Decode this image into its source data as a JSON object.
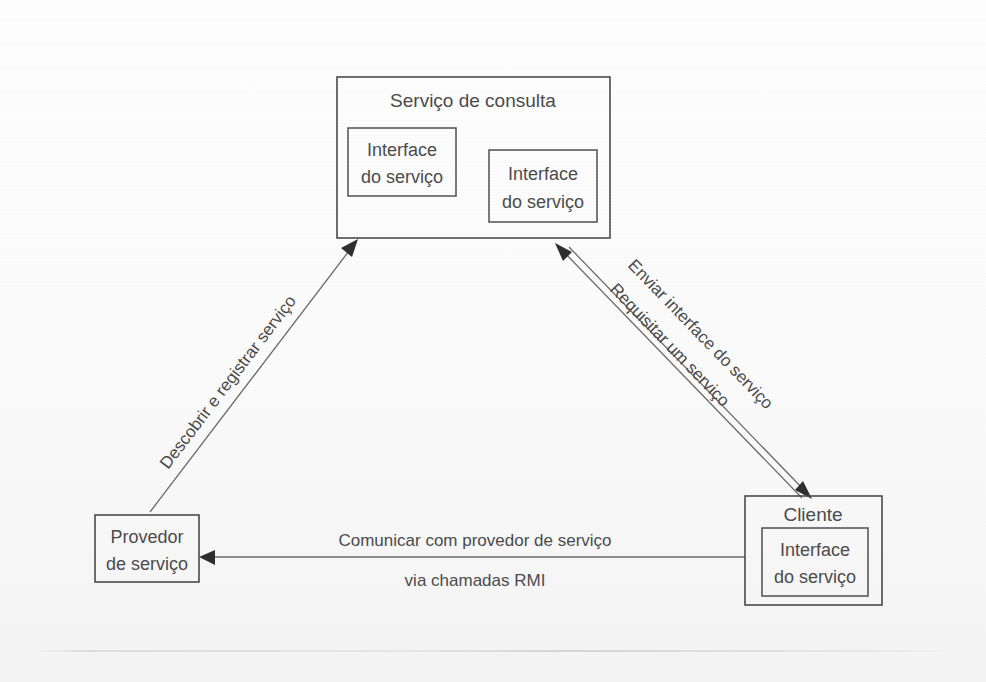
{
  "diagram": {
    "language": "pt-BR",
    "colors": {
      "background": "#fefefe",
      "box_stroke": "#4a4a4a",
      "connector_stroke": "#6a6a6a",
      "arrowhead_fill": "#2e2e2e",
      "text": "#4b4b4b"
    },
    "nodes": {
      "registry": {
        "title": "Serviço de consulta",
        "interfaces": [
          {
            "line1": "Interface",
            "line2": "do serviço"
          },
          {
            "line1": "Interface",
            "line2": "do serviço"
          }
        ]
      },
      "provider": {
        "line1": "Provedor",
        "line2": "de serviço"
      },
      "client": {
        "title": "Cliente",
        "interface": {
          "line1": "Interface",
          "line2": "do serviço"
        }
      }
    },
    "edges": {
      "discover_register": {
        "label": "Descobrir e registrar serviço",
        "from": "provider",
        "to": "registry"
      },
      "send_interface": {
        "label": "Enviar interface do serviço",
        "from": "registry",
        "to": "client"
      },
      "request_service": {
        "label": "Requisitar um serviço",
        "from": "client",
        "to": "registry"
      },
      "communicate": {
        "label_line1": "Comunicar com provedor de serviço",
        "label_line2": "via chamadas RMI",
        "from": "client",
        "to": "provider"
      }
    }
  }
}
